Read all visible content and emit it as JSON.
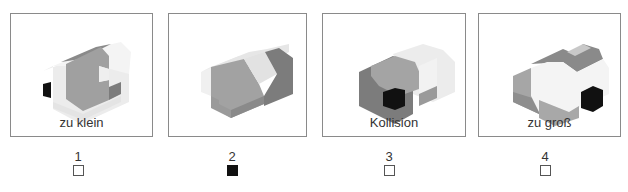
{
  "panels": [
    {
      "id": 1,
      "caption": "zu klein",
      "checked": false
    },
    {
      "id": 2,
      "caption": "",
      "checked": true
    },
    {
      "id": 3,
      "caption": "Kollision",
      "checked": false
    },
    {
      "id": 4,
      "caption": "zu groß",
      "checked": false
    }
  ],
  "options": [
    {
      "number": "1",
      "checked": false
    },
    {
      "number": "2",
      "checked": true
    },
    {
      "number": "3",
      "checked": false
    },
    {
      "number": "4",
      "checked": false
    }
  ],
  "colors": {
    "border": "#8a8a8a",
    "light": "#e8e8e8",
    "white_face": "#f4f4f4",
    "mid": "#a6a6a6",
    "dark": "#7c7c7c",
    "black": "#111111"
  }
}
